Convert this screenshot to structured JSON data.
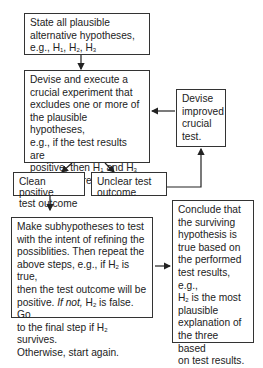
{
  "diagram": {
    "type": "flowchart",
    "nodes": {
      "state": {
        "line1": "State all plausible",
        "line2": "alternative hypotheses,",
        "line3_prefix": "e.g., H",
        "sub1": "1",
        "sep1": ", H",
        "sub2": "2",
        "sep2": ", H",
        "sub3": "3"
      },
      "devise": {
        "l1": "Devise and execute a",
        "l2": "crucial experiment that",
        "l3": "excludes one or more of",
        "l4": "the plausible hypotheses,",
        "l5": "e.g., if the test results are",
        "l6a": "positive, then H",
        "l6s1": "1",
        "l6b": " and H",
        "l6s2": "3",
        "l7": "are considered falsified."
      },
      "improved": {
        "l1": "Devise",
        "l2": "improved",
        "l3": "crucial",
        "l4": "test."
      },
      "clean": {
        "l1": "Clean positive",
        "l2": "test outcome"
      },
      "unclear": {
        "l1": "Unclear test",
        "l2": "outcome"
      },
      "sub": {
        "l1": "Make subhypotheses to test",
        "l2": "with the intent of refining the",
        "l3": "possiblities. Then repeat the",
        "l4a": "above steps, e.g., if H",
        "l4s": "2",
        "l4b": " is true,",
        "l5": "then the test outcome will be",
        "l6a": "positive. ",
        "l6i": "If not,",
        "l6b": " H",
        "l6s": "2",
        "l6c": " is false. Go",
        "l7a": "to the final step if H",
        "l7s": "2",
        "l7b": " survives.",
        "l8": "Otherwise, start again."
      },
      "conclude": {
        "l1": "Conclude that",
        "l2": "the surviving",
        "l3": "hypothesis is",
        "l4": "true based on",
        "l5": "the performed",
        "l6": "test results, e.g.,",
        "l7a": "H",
        "l7s": "2",
        "l7b": " is the most",
        "l8": "plausible",
        "l9": "explanation of",
        "l10": "the three based",
        "l11": "on test results."
      }
    },
    "edges": [
      {
        "from": "state",
        "to": "devise"
      },
      {
        "from": "improved",
        "to": "devise"
      },
      {
        "from": "devise",
        "to": "clean"
      },
      {
        "from": "devise",
        "to": "unclear"
      },
      {
        "from": "unclear",
        "to": "improved"
      },
      {
        "from": "clean",
        "to": "sub"
      },
      {
        "from": "sub",
        "to": "conclude"
      }
    ]
  }
}
